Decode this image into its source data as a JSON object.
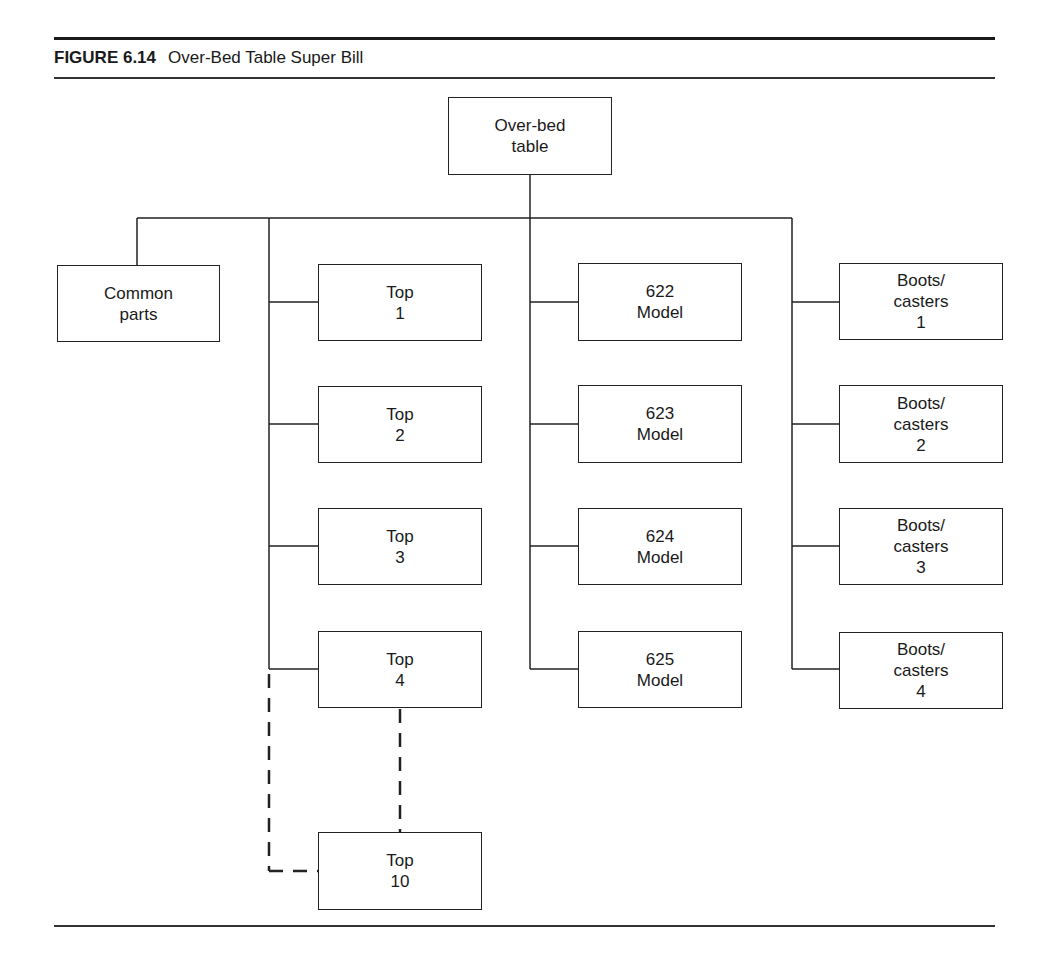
{
  "figure": {
    "number": "FIGURE 6.14",
    "title": "Over-Bed Table Super Bill"
  },
  "diagram": {
    "type": "hierarchy / bill of materials tree",
    "root": {
      "label": "Over-bed\ntable"
    },
    "common": {
      "label": "Common\nparts"
    },
    "tops": [
      {
        "label": "Top\n1"
      },
      {
        "label": "Top\n2"
      },
      {
        "label": "Top\n3"
      },
      {
        "label": "Top\n4"
      }
    ],
    "top_extra": {
      "label": "Top\n10",
      "connection": "dashed (continuation Top 4 … Top 10)"
    },
    "models": [
      {
        "label": "622\nModel"
      },
      {
        "label": "623\nModel"
      },
      {
        "label": "624\nModel"
      },
      {
        "label": "625\nModel"
      }
    ],
    "boots": [
      {
        "label": "Boots/\ncasters\n1"
      },
      {
        "label": "Boots/\ncasters\n2"
      },
      {
        "label": "Boots/\ncasters\n3"
      },
      {
        "label": "Boots/\ncasters\n4"
      }
    ]
  },
  "colors": {
    "line": "#222222",
    "background": "#ffffff",
    "text": "#1a1a1a"
  }
}
